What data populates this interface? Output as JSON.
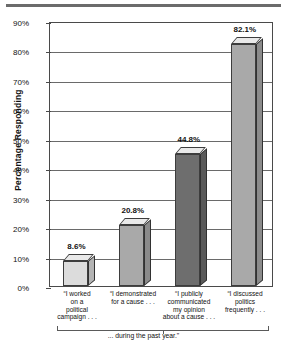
{
  "chart_data": {
    "type": "bar",
    "title": "",
    "subtitle": "",
    "xlabel": "",
    "ylabel": "Percentage Responding",
    "ylim": [
      0,
      90
    ],
    "ytick_step": 10,
    "ytick_labels": [
      "0%",
      "10%",
      "20%",
      "30%",
      "40%",
      "50%",
      "60%",
      "70%",
      "80%",
      "90%"
    ],
    "grid": true,
    "legend": "none",
    "caption": "... during the past year.\"",
    "categories": [
      "“I worked\non a\npolitical\ncampaign . . .",
      "“I demonstrated\nfor a cause . . .",
      "“I publicly\ncommunicated\nmy opinion\nabout a cause . . .",
      "“I discussed\npolitics\nfrequently . . ."
    ],
    "values": [
      8.6,
      20.8,
      44.8,
      82.1
    ],
    "value_labels": [
      "8.6%",
      "20.8%",
      "44.8%",
      "82.1%"
    ],
    "bar_colors": [
      "#dcdcdc",
      "#a9a9a9",
      "#6e6e6e",
      "#a9a9a9"
    ],
    "series": [
      {
        "name": "Percentage Responding",
        "values": [
          8.6,
          20.8,
          44.8,
          82.1
        ]
      }
    ]
  },
  "axis": {
    "y_title": "Percentage Responding"
  }
}
